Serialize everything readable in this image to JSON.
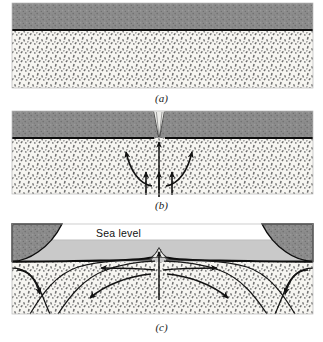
{
  "figure": {
    "panels": [
      {
        "id": "a",
        "caption": "(a)",
        "description": "Undisturbed continental crust over asthenosphere"
      },
      {
        "id": "b",
        "caption": "(b)",
        "description": "Rifting begins: mantle upwelling and divergent flow beneath thinning crust"
      },
      {
        "id": "c",
        "caption": "(c)",
        "description": "Ocean basin forms with mid-ocean ridge; continents drift apart"
      }
    ],
    "annotations": {
      "sea_level": "Sea level"
    }
  },
  "colors": {
    "crust": "#8b8b8b",
    "crust_dark": "#7d7d7d",
    "mantle": "#f4f3ef",
    "stipple": "#6b6b6b",
    "water": "#c9c9c9",
    "outline": "#0d0d0d",
    "arrow": "#111111",
    "background": "#ffffff",
    "caption_text": "#1a1a1a"
  },
  "geometry": {
    "frame": {
      "left": 12,
      "right": 313
    },
    "panel_a": {
      "top": 3,
      "crust_bottom": 30,
      "bottom": 88
    },
    "panel_b": {
      "top": 3,
      "crust_bottom": 30,
      "bottom": 86,
      "rift_center_x": 159
    },
    "panel_c": {
      "top": 6,
      "sea_top": 22,
      "sea_bottom": 44,
      "bottom": 96,
      "ridge_center_x": 159
    }
  }
}
